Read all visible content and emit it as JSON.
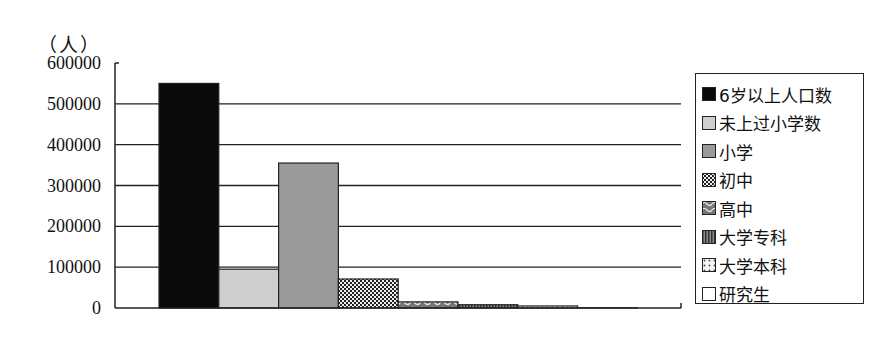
{
  "chart_data": {
    "type": "bar",
    "title": "",
    "ylabel": "（人）",
    "xlabel": "",
    "ylim": [
      0,
      600000
    ],
    "yticks": [
      0,
      100000,
      200000,
      300000,
      400000,
      500000,
      600000
    ],
    "ytick_labels": [
      "0",
      "100000",
      "200000",
      "300000",
      "400000",
      "500000",
      "600000"
    ],
    "grid": true,
    "legend_position": "right",
    "categories": [
      "6岁以上人口数",
      "未上过小学数",
      "小学",
      "初中",
      "高中",
      "大学专科",
      "大学本科",
      "研究生"
    ],
    "values": [
      550000,
      95000,
      355000,
      71000,
      15000,
      8000,
      5000,
      500
    ],
    "series": [
      {
        "name": "6岁以上人口数",
        "value": 550000,
        "fill": "#0a0a0a",
        "pattern": "solid"
      },
      {
        "name": "未上过小学数",
        "value": 95000,
        "fill": "#cfcfcf",
        "pattern": "solid"
      },
      {
        "name": "小学",
        "value": 355000,
        "fill": "#9a9a9a",
        "pattern": "solid"
      },
      {
        "name": "初中",
        "value": 71000,
        "fill": "#6a6a6a",
        "pattern": "checker"
      },
      {
        "name": "高中",
        "value": 15000,
        "fill": "#3a3a3a",
        "pattern": "wave"
      },
      {
        "name": "大学专科",
        "value": 8000,
        "fill": "#555555",
        "pattern": "vstripe"
      },
      {
        "name": "大学本科",
        "value": 5000,
        "fill": "#ffffff",
        "pattern": "dots"
      },
      {
        "name": "研究生",
        "value": 500,
        "fill": "#ffffff",
        "pattern": "solid"
      }
    ]
  },
  "axis": {
    "unit_label": "（人）"
  }
}
